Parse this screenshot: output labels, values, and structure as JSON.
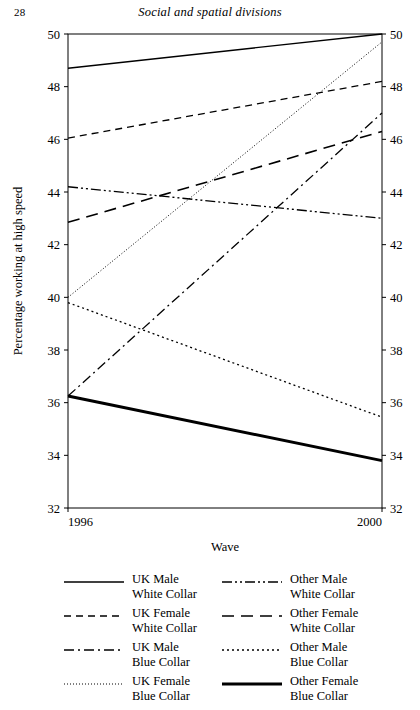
{
  "page": {
    "folio": "28",
    "running_head": "Social and spatial divisions"
  },
  "chart_data": {
    "type": "line",
    "title": "",
    "xlabel": "Wave",
    "ylabel": "Percentage working at high speed",
    "x": [
      "1996",
      "2000"
    ],
    "xtick_labels": [
      "1996",
      "2000"
    ],
    "ytick_labels": [
      "32",
      "34",
      "36",
      "38",
      "40",
      "42",
      "44",
      "46",
      "48",
      "50"
    ],
    "ylim": [
      32,
      50
    ],
    "ytick_step": 2,
    "grid": false,
    "right_axis_labels": true,
    "legend_position": "below-plot-two-columns",
    "series": [
      {
        "name": "UK Male White Collar",
        "style": "solid",
        "values": [
          48.7,
          50.0
        ]
      },
      {
        "name": "UK Female White Collar",
        "style": "dashed",
        "values": [
          46.05,
          48.2
        ]
      },
      {
        "name": "UK Male Blue Collar",
        "style": "dash-dot",
        "values": [
          36.25,
          47.0
        ]
      },
      {
        "name": "UK Female Blue Collar",
        "style": "fine-dotted",
        "values": [
          40.0,
          49.7
        ]
      },
      {
        "name": "Other Male White Collar",
        "style": "dash-dot-dot",
        "values": [
          44.2,
          43.0
        ]
      },
      {
        "name": "Other Female White Collar",
        "style": "long-dash",
        "values": [
          42.85,
          46.3
        ]
      },
      {
        "name": "Other Male Blue Collar",
        "style": "coarse-dotted",
        "values": [
          39.8,
          35.45
        ]
      },
      {
        "name": "Other Female Blue Collar",
        "style": "thick-solid",
        "values": [
          36.25,
          33.8
        ]
      }
    ]
  },
  "legend": {
    "items": [
      {
        "line1": "UK Male",
        "line2": "White Collar",
        "key": "solid"
      },
      {
        "line1": "Other Male",
        "line2": "White Collar",
        "key": "dash-dot-dot"
      },
      {
        "line1": "UK Female",
        "line2": "White Collar",
        "key": "dashed"
      },
      {
        "line1": "Other Female",
        "line2": "White Collar",
        "key": "long-dash"
      },
      {
        "line1": "UK Male",
        "line2": "Blue Collar",
        "key": "dash-dot"
      },
      {
        "line1": "Other Male",
        "line2": "Blue Collar",
        "key": "coarse-dotted"
      },
      {
        "line1": "UK Female",
        "line2": "Blue Collar",
        "key": "fine-dotted"
      },
      {
        "line1": "Other Female",
        "line2": "Blue Collar",
        "key": "thick-solid"
      }
    ]
  },
  "colors": {
    "ink": "#000000",
    "paper": "#ffffff"
  }
}
